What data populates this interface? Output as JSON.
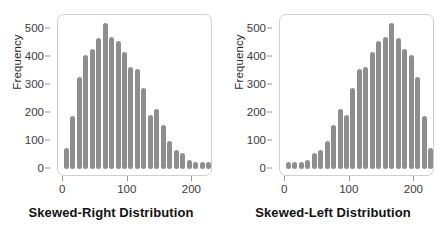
{
  "figure": {
    "background": "#ffffff",
    "bar_color": "#8e8e8e",
    "frame_color": "#cfcfcf",
    "tick_color": "#9a9a9a"
  },
  "chart_data": [
    {
      "type": "bar",
      "title": "Skewed-Right Distribution",
      "xlabel": "",
      "ylabel": "Frequency",
      "xlim": [
        -8,
        232
      ],
      "ylim": [
        0,
        530
      ],
      "grid": false,
      "legend": null,
      "xticks": [
        0,
        100,
        200
      ],
      "xticklabels": [
        "0",
        "100",
        "200"
      ],
      "yticks": [
        0,
        100,
        200,
        300,
        400,
        500
      ],
      "yticklabels": [
        "0",
        "100",
        "200",
        "300",
        "400",
        "500"
      ],
      "bin_width": 10,
      "categories": [
        5,
        15,
        25,
        35,
        45,
        55,
        65,
        75,
        85,
        95,
        105,
        115,
        125,
        135,
        145,
        155,
        165,
        175,
        185,
        195,
        205,
        215,
        225
      ],
      "values": [
        55,
        170,
        310,
        390,
        410,
        450,
        505,
        455,
        440,
        400,
        345,
        340,
        270,
        175,
        195,
        140,
        80,
        50,
        40,
        15,
        5,
        5,
        5
      ]
    },
    {
      "type": "bar",
      "title": "Skewed-Left Distribution",
      "xlabel": "",
      "ylabel": "Frequency",
      "xlim": [
        -8,
        232
      ],
      "ylim": [
        0,
        530
      ],
      "grid": false,
      "legend": null,
      "xticks": [
        0,
        100,
        200
      ],
      "xticklabels": [
        "0",
        "100",
        "200"
      ],
      "yticks": [
        0,
        100,
        200,
        300,
        400,
        500
      ],
      "yticklabels": [
        "0",
        "100",
        "200",
        "300",
        "400",
        "500"
      ],
      "bin_width": 10,
      "categories": [
        5,
        15,
        25,
        35,
        45,
        55,
        65,
        75,
        85,
        95,
        105,
        115,
        125,
        135,
        145,
        155,
        165,
        175,
        185,
        195,
        205,
        215,
        225
      ],
      "values": [
        5,
        5,
        5,
        15,
        40,
        50,
        80,
        140,
        195,
        175,
        270,
        340,
        345,
        400,
        440,
        455,
        505,
        450,
        410,
        390,
        310,
        170,
        55
      ]
    }
  ]
}
